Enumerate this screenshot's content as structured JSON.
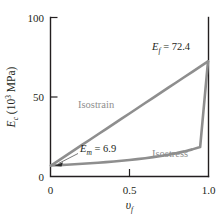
{
  "figure": {
    "name": "modulus-vs-fiber-volume-fraction",
    "background_color": "#ffffff",
    "curve_color": "#8e8e8e",
    "axis_color": "#231f20"
  },
  "axes": {
    "y": {
      "label_main": "E",
      "label_sub": "c",
      "label_unit_open": " (10",
      "label_unit_exp": "3",
      "label_unit_close": " MPa)",
      "ticks": [
        "0",
        "50",
        "100"
      ],
      "tick_values": [
        0,
        50,
        100
      ],
      "range": [
        0,
        100
      ]
    },
    "x": {
      "label_main": "υ",
      "label_sub": "f",
      "ticks": [
        "0",
        "0.5",
        "1.0"
      ],
      "tick_values": [
        0,
        0.5,
        1.0
      ],
      "range": [
        0,
        1.0
      ]
    }
  },
  "annotations": {
    "ef": {
      "symbol": "E",
      "subscript": "f",
      "equals": " = 72.4",
      "full": "Ef = 72.4",
      "value": 72.4
    },
    "em": {
      "symbol": "E",
      "subscript": "m",
      "equals": " = 6.9",
      "full": "Em = 6.9",
      "value": 6.9
    },
    "isostrain_label": "Isostrain",
    "isostress_label": "Isostress"
  },
  "chart_data": {
    "type": "line",
    "title": "",
    "xlabel": "vf",
    "ylabel": "Ec (10^3 MPa)",
    "xlim": [
      0,
      1.0
    ],
    "ylim": [
      0,
      100
    ],
    "xticks": [
      0,
      0.5,
      1.0
    ],
    "yticks": [
      0,
      50,
      100
    ],
    "grid": false,
    "legend": "inline-annotations",
    "constants": {
      "Em": 6.9,
      "Ef": 72.4,
      "units": "10^3 MPa"
    },
    "x": [
      0,
      0.05,
      0.1,
      0.15,
      0.2,
      0.25,
      0.3,
      0.35,
      0.4,
      0.45,
      0.5,
      0.55,
      0.6,
      0.65,
      0.7,
      0.75,
      0.8,
      0.85,
      0.9,
      0.95,
      1.0
    ],
    "series": [
      {
        "name": "Isostrain",
        "formula": "Ec = Em(1 - vf) + Ef*vf",
        "color": "#8e8e8e",
        "values": [
          6.9,
          10.18,
          13.45,
          16.73,
          20.0,
          23.28,
          26.55,
          29.83,
          33.1,
          36.38,
          39.65,
          42.93,
          46.2,
          49.48,
          52.75,
          56.03,
          59.3,
          62.58,
          65.85,
          69.13,
          72.4
        ]
      },
      {
        "name": "Isostress",
        "formula": "Ec = Em*Ef / (Em*vf + Ef(1 - vf))",
        "color": "#8e8e8e",
        "values": [
          6.9,
          7.15,
          7.42,
          7.7,
          8.01,
          8.33,
          8.68,
          9.06,
          9.47,
          9.92,
          10.4,
          10.94,
          11.53,
          12.19,
          12.93,
          13.76,
          14.71,
          15.79,
          17.06,
          18.55,
          72.4
        ]
      }
    ]
  }
}
